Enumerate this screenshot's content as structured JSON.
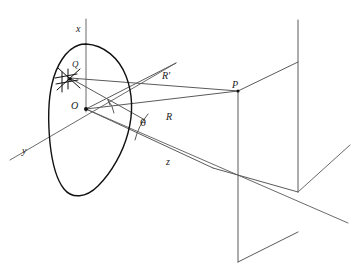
{
  "figure": {
    "type": "diagram",
    "background_color": "#ffffff",
    "stroke_color": "#4a4a4a",
    "aperture_stroke_color": "#1a1a1a",
    "text_color": "#1a1a1a"
  },
  "axes": {
    "x": {
      "label": "x",
      "label_x": 76,
      "label_y": 24
    },
    "y": {
      "label": "y",
      "label_x": 22,
      "label_y": 146
    },
    "z": {
      "label": "z",
      "label_x": 166,
      "label_y": 157
    }
  },
  "points": {
    "Q": {
      "label": "Q",
      "label_x": 72,
      "label_y": 60,
      "marker": "hatch-cross-marker",
      "px": 70,
      "py": 78
    },
    "O": {
      "label": "O",
      "label_x": 71,
      "label_y": 101,
      "marker": "origin-dot",
      "px": 86,
      "py": 109
    },
    "P": {
      "label": "P",
      "label_x": 232,
      "label_y": 80,
      "marker": "plane-corner",
      "px": 238,
      "py": 91
    }
  },
  "vectors": {
    "R_prime": {
      "label": "R′",
      "label_x": 162,
      "label_y": 71,
      "from": "Q",
      "to": "P"
    },
    "R": {
      "label": "R",
      "label_x": 166,
      "label_y": 112,
      "from": "O",
      "to": "P"
    }
  },
  "angles": {
    "theta": {
      "label": "θ",
      "label_x": 140,
      "label_y": 118,
      "between": [
        "R",
        "z-axis"
      ]
    },
    "right_angle": {
      "marker": "right-angle-arc",
      "at": "O"
    }
  },
  "shapes": {
    "aperture": {
      "name": "irregular-aperture-outline"
    },
    "observation_plane": {
      "name": "observation-plane-parallelogram"
    }
  }
}
